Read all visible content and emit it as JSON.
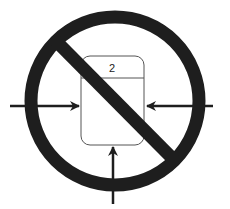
{
  "diagram": {
    "type": "prohibition-symbol",
    "box": {
      "label": "2"
    },
    "arrows": [
      {
        "id": "left",
        "direction": "right"
      },
      {
        "id": "right",
        "direction": "left"
      },
      {
        "id": "bottom",
        "direction": "up"
      }
    ],
    "colors": {
      "stroke": "#1e1e1e",
      "box_border": "#555555",
      "background": "#ffffff"
    }
  }
}
